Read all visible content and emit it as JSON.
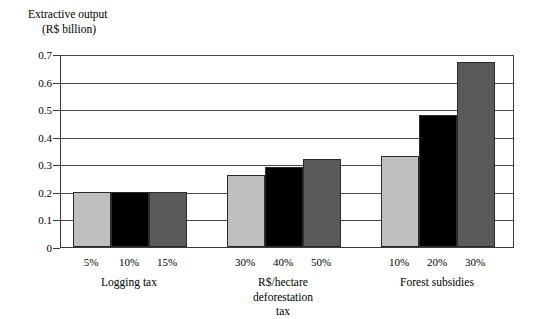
{
  "chart_data": {
    "type": "bar",
    "title": "Extractive output",
    "subtitle": "(R$ billion)",
    "xlabel": "",
    "ylabel": "Extractive output (R$ billion)",
    "ylim": [
      0,
      0.7
    ],
    "grid": true,
    "legend": "none",
    "y_ticks": [
      "0",
      "0.1",
      "0.2",
      "0.3",
      "0.4",
      "0.5",
      "0.6",
      "0.7"
    ],
    "y_tick_values": [
      0,
      0.1,
      0.2,
      0.3,
      0.4,
      0.5,
      0.6,
      0.7
    ],
    "categories": [
      "5%",
      "10%",
      "15%",
      "30%",
      "40%",
      "50%",
      "10%",
      "20%",
      "30%"
    ],
    "values": [
      0.2,
      0.2,
      0.2,
      0.26,
      0.29,
      0.32,
      0.33,
      0.48,
      0.67
    ],
    "groups": [
      {
        "label": "Logging tax",
        "label_lines": [
          "Logging tax"
        ],
        "categories": [
          "5%",
          "10%",
          "15%"
        ],
        "values": [
          0.2,
          0.2,
          0.2
        ]
      },
      {
        "label": "R$/hectare deforestation tax",
        "label_lines": [
          "R$/hectare",
          "deforestation",
          "tax"
        ],
        "categories": [
          "30%",
          "40%",
          "50%"
        ],
        "values": [
          0.26,
          0.29,
          0.32
        ]
      },
      {
        "label": "Forest subsidies",
        "label_lines": [
          "Forest subsidies"
        ],
        "categories": [
          "10%",
          "20%",
          "30%"
        ],
        "values": [
          0.33,
          0.48,
          0.67
        ]
      }
    ],
    "bar_colors": [
      "#bfbfbf",
      "#000000",
      "#5a5a5a"
    ],
    "colors": {
      "light_gray": "#bfbfbf",
      "black": "#000000",
      "dark_gray": "#5a5a5a",
      "axis": "#3a3a3a",
      "gridline": "#4a4a4a",
      "background": "#ffffff"
    }
  }
}
